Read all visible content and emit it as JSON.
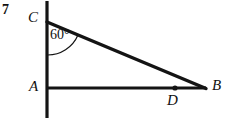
{
  "figure": {
    "problem_number": "7",
    "stroke_color": "#141414",
    "background_color": "#ffffff",
    "width": 233,
    "height": 118,
    "points": [
      {
        "id": "C",
        "label": "C",
        "x": 47,
        "y": 22,
        "dot": false
      },
      {
        "id": "A",
        "label": "A",
        "x": 47,
        "y": 88,
        "dot": false
      },
      {
        "id": "B",
        "label": "B",
        "x": 205,
        "y": 88,
        "dot": false
      },
      {
        "id": "D",
        "label": "D",
        "x": 175,
        "y": 88,
        "dot": true
      }
    ],
    "segments": [
      {
        "id": "vertical-line",
        "x1": 47,
        "y1": 2,
        "x2": 47,
        "y2": 118,
        "width": 3
      },
      {
        "id": "segment-AB",
        "x1": 47,
        "y1": 88,
        "x2": 205,
        "y2": 88,
        "width": 3
      },
      {
        "id": "segment-CB",
        "x1": 47,
        "y1": 22,
        "x2": 205,
        "y2": 88,
        "width": 3
      }
    ],
    "angle": {
      "vertex": "C",
      "value": "60",
      "unit": "°",
      "label": "60°",
      "arc_radius": 33
    }
  }
}
